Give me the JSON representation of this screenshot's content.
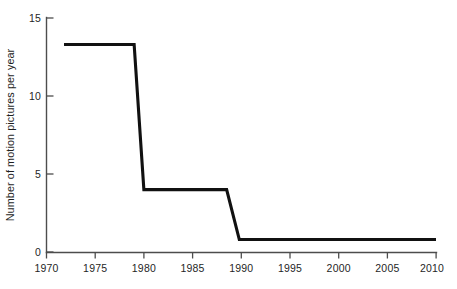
{
  "chart_data": {
    "type": "line",
    "title": "",
    "subtitle": "",
    "xlabel": "",
    "ylabel": "Number of motion pictures per year",
    "xlim": [
      1970,
      2010
    ],
    "ylim": [
      0,
      15
    ],
    "grid": false,
    "legend": null,
    "xticks": [
      1970,
      1975,
      1980,
      1985,
      1990,
      1995,
      2000,
      2005,
      2010
    ],
    "xtick_labels": [
      "1970",
      "1975",
      "1980",
      "1985",
      "1990",
      "1995",
      "2000",
      "2005",
      "2010"
    ],
    "yticks": [
      0,
      5,
      10,
      15
    ],
    "ytick_labels": [
      "0",
      "5",
      "10",
      "15"
    ],
    "series": [
      {
        "name": "Number of motion pictures per year",
        "color": "#111111",
        "x": [
          1971.8,
          1979.0,
          1980.0,
          1988.5,
          1989.8,
          2010.0
        ],
        "values": [
          13.3,
          13.3,
          4.0,
          4.0,
          0.8,
          0.8
        ]
      }
    ],
    "annotations": [],
    "steps": [
      {
        "from_year": 1971.8,
        "to_year": 1979.0,
        "level": 13.3
      },
      {
        "from_year": 1980.0,
        "to_year": 1988.5,
        "level": 4.0
      },
      {
        "from_year": 1989.8,
        "to_year": 2010.0,
        "level": 0.8
      }
    ]
  },
  "axes": {
    "y_axis_title": "Number of motion pictures per year",
    "x_axis_title": ""
  },
  "caption": {
    "text": ""
  },
  "colors": {
    "data_line": "#111111",
    "axis": "#4d4d4d",
    "text": "#1f1f1f",
    "background": "#ffffff"
  }
}
